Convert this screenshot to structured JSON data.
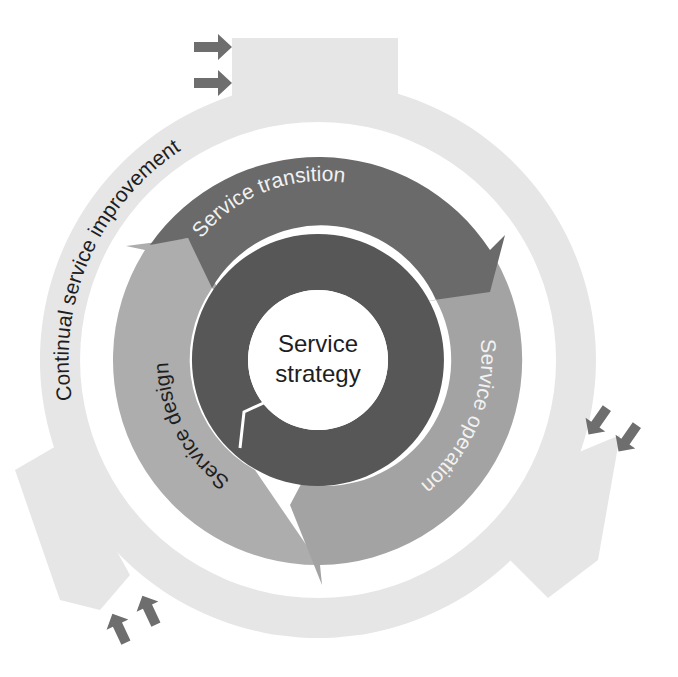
{
  "diagram": {
    "center_label": {
      "line1": "Service",
      "line2": "strategy"
    },
    "stages": [
      {
        "id": "transition",
        "label": "Service transition",
        "color": "#6a6a6a",
        "text_color": "#f2f2f2"
      },
      {
        "id": "operation",
        "label": "Service operation",
        "color": "#a3a3a3",
        "text_color": "#f5f5f5"
      },
      {
        "id": "design",
        "label": "Service design",
        "color": "#adadad",
        "text_color": "#1e1e1e"
      }
    ],
    "outer_ring": {
      "label": "Continual service improvement",
      "color": "#e6e6e6"
    },
    "colors": {
      "core_ring": "#575757",
      "center_disk": "#ffffff",
      "input_arrows": "#6e6e6e",
      "background": "#ffffff"
    },
    "input_arrow_groups": [
      {
        "position": "top",
        "count": 2,
        "direction": "right"
      },
      {
        "position": "right",
        "count": 2,
        "direction": "down-left"
      },
      {
        "position": "bottom-left",
        "count": 2,
        "direction": "up"
      }
    ]
  }
}
